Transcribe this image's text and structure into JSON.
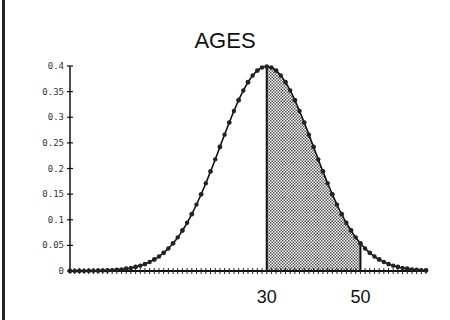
{
  "chart_data": {
    "type": "area",
    "title": "AGES",
    "xlabel": "",
    "ylabel": "",
    "distribution": "normal",
    "mean": 30,
    "sd": 10,
    "ylim": [
      0,
      0.4
    ],
    "xlim": [
      -12,
      64
    ],
    "yticks": [
      "0",
      "0.05",
      "0.1",
      "0.15",
      "0.2",
      "0.25",
      "0.3",
      "0.35",
      "0.4"
    ],
    "xtick_labels": [
      {
        "value": 30,
        "label": "30"
      },
      {
        "value": 50,
        "label": "50"
      }
    ],
    "shaded_region": {
      "from": 30,
      "to": 50
    },
    "note": "y values plotted as standard normal density (peak ~0.399 at x=30)",
    "x": [
      -12,
      -10,
      -8,
      -6,
      -4,
      -2,
      0,
      2,
      4,
      6,
      8,
      10,
      12,
      14,
      16,
      18,
      20,
      22,
      24,
      26,
      28,
      30,
      32,
      34,
      36,
      38,
      40,
      42,
      44,
      46,
      48,
      50,
      52,
      54,
      56,
      58,
      60,
      62,
      64
    ],
    "values": [
      0.0001,
      0.0001,
      0.0003,
      0.0007,
      0.0012,
      0.0022,
      0.0044,
      0.0079,
      0.0136,
      0.0224,
      0.0355,
      0.054,
      0.079,
      0.1109,
      0.1497,
      0.1942,
      0.242,
      0.2897,
      0.3332,
      0.3683,
      0.391,
      0.3989,
      0.391,
      0.3683,
      0.3332,
      0.2897,
      0.242,
      0.1942,
      0.1497,
      0.1109,
      0.079,
      0.054,
      0.0355,
      0.0224,
      0.0136,
      0.0079,
      0.0044,
      0.0022,
      0.0012
    ]
  }
}
